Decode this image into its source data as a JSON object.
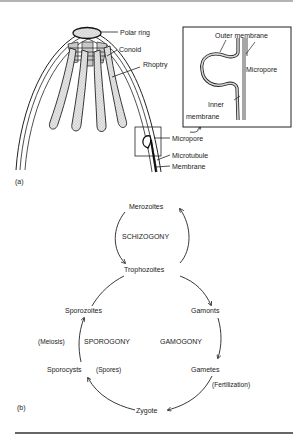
{
  "figure": {
    "panel_a": {
      "label": "(a)",
      "callouts": {
        "polar_ring": "Polar ring",
        "conoid": "Conoid",
        "rhoptry": "Rhoptry",
        "micropore": "Micropore",
        "microtubule": "Microtubule",
        "membrane": "Membrane"
      },
      "inset": {
        "outer_membrane": "Outer membrane",
        "micropore": "Micropore",
        "inner_membrane_line1": "Inner",
        "inner_membrane_line2": "membrane"
      }
    },
    "panel_b": {
      "label": "(b)",
      "stages": {
        "merozoites": "Merozoites",
        "trophozoites": "Trophozoites",
        "gamonts": "Gamonts",
        "gametes": "Gametes",
        "zygote": "Zygote",
        "sporocysts": "Sporocysts",
        "spores": "(Spores)",
        "sporozoites": "Sporozoites"
      },
      "processes": {
        "schizogony": "SCHIZOGONY",
        "gamogony": "GAMOGONY",
        "sporogony": "SPOROGONY"
      },
      "annotations": {
        "meiosis": "(Meiosis)",
        "fertilization": "(Fertilization)"
      }
    }
  }
}
